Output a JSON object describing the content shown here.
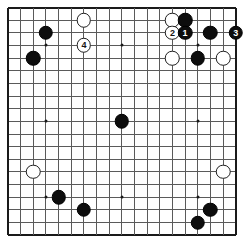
{
  "board": {
    "type": "go-board",
    "size": 19,
    "label": "Go board 19x19",
    "line_color": "#5a5a5a",
    "edge_color": "#1a1a1a",
    "background_color": "#ffffff",
    "black_color": "#0d0d0d",
    "white_color": "#ffffff",
    "geometry": {
      "origin_x": 8.0,
      "origin_y": 7.5,
      "spacing": 12.65,
      "stone_diameter": 14.5,
      "label_font_size": 9
    },
    "star_points": [
      {
        "col": 3,
        "row": 3
      },
      {
        "col": 9,
        "row": 3
      },
      {
        "col": 15,
        "row": 3
      },
      {
        "col": 3,
        "row": 9
      },
      {
        "col": 9,
        "row": 9
      },
      {
        "col": 15,
        "row": 9
      },
      {
        "col": 3,
        "row": 15
      },
      {
        "col": 9,
        "row": 15
      },
      {
        "col": 15,
        "row": 15
      }
    ],
    "stones": [
      {
        "col": 6,
        "row": 1,
        "color": "white",
        "label": "",
        "name": "stone-white-g18"
      },
      {
        "col": 3,
        "row": 2,
        "color": "black",
        "label": "",
        "name": "stone-black-d17"
      },
      {
        "col": 6,
        "row": 3,
        "color": "white",
        "label": "4",
        "name": "stone-white-move-4"
      },
      {
        "col": 2,
        "row": 4,
        "color": "black",
        "label": "",
        "name": "stone-black-c15"
      },
      {
        "col": 13,
        "row": 1,
        "color": "white",
        "label": "",
        "name": "stone-white-n18"
      },
      {
        "col": 14,
        "row": 1,
        "color": "black",
        "label": "",
        "name": "stone-black-o18"
      },
      {
        "col": 13,
        "row": 2,
        "color": "white",
        "label": "2",
        "name": "stone-white-move-2"
      },
      {
        "col": 14,
        "row": 2,
        "color": "black",
        "label": "1",
        "name": "stone-black-move-1"
      },
      {
        "col": 16,
        "row": 2,
        "color": "black",
        "label": "",
        "name": "stone-black-q17"
      },
      {
        "col": 18,
        "row": 2,
        "color": "black",
        "label": "3",
        "name": "stone-black-move-3"
      },
      {
        "col": 13,
        "row": 4,
        "color": "white",
        "label": "",
        "name": "stone-white-n15"
      },
      {
        "col": 15,
        "row": 4,
        "color": "black",
        "label": "",
        "name": "stone-black-p15"
      },
      {
        "col": 17,
        "row": 4,
        "color": "white",
        "label": "",
        "name": "stone-white-r15"
      },
      {
        "col": 9,
        "row": 9,
        "color": "black",
        "label": "",
        "name": "stone-black-tengen"
      },
      {
        "col": 2,
        "row": 13,
        "color": "white",
        "label": "",
        "name": "stone-white-c6"
      },
      {
        "col": 4,
        "row": 15,
        "color": "black",
        "label": "",
        "name": "stone-black-e4"
      },
      {
        "col": 6,
        "row": 16,
        "color": "black",
        "label": "",
        "name": "stone-black-g3"
      },
      {
        "col": 17,
        "row": 13,
        "color": "white",
        "label": "",
        "name": "stone-white-r6"
      },
      {
        "col": 16,
        "row": 16,
        "color": "black",
        "label": "",
        "name": "stone-black-q3"
      },
      {
        "col": 15,
        "row": 17,
        "color": "black",
        "label": "",
        "name": "stone-black-p2"
      }
    ],
    "move_sequence": [
      {
        "number": "1",
        "color": "black"
      },
      {
        "number": "2",
        "color": "white"
      },
      {
        "number": "3",
        "color": "black"
      },
      {
        "number": "4",
        "color": "white"
      }
    ]
  }
}
